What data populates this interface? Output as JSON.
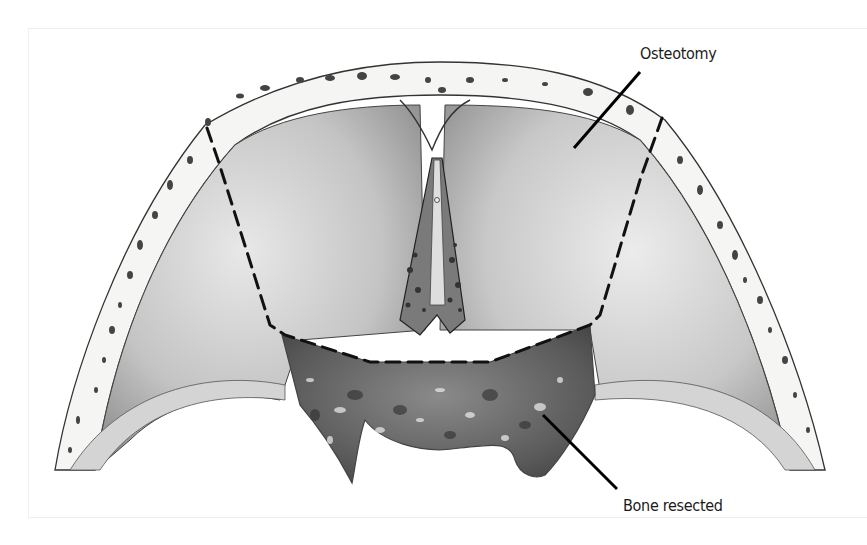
{
  "figure": {
    "labels": {
      "osteotomy": "Osteotomy",
      "bone_resected": "Bone resected"
    },
    "icons": {
      "osteotomy_line": "dashed-cut-line",
      "leader_lines": "callout-leader"
    },
    "colors": {
      "background": "#ffffff",
      "bone_outer": "#f4f4f2",
      "brain_fill": "#c9c9c9",
      "resected": "#6a6a6a",
      "line": "#111111"
    }
  }
}
